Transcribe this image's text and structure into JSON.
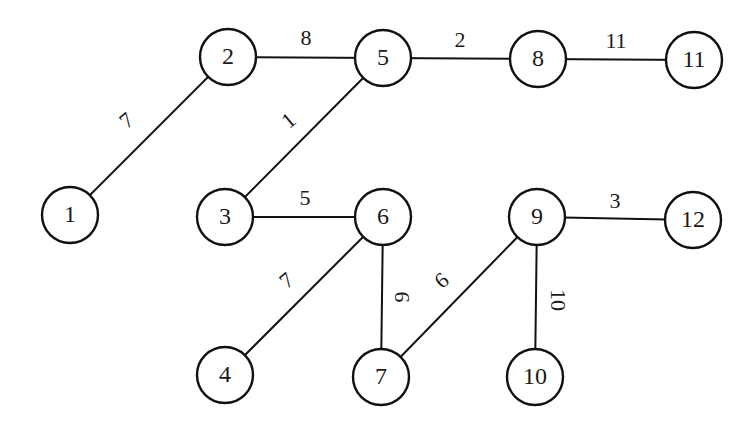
{
  "diagram": {
    "type": "weighted-undirected-graph",
    "style": {
      "line_color": "#111111",
      "background": "#ffffff",
      "node_radius": 28
    },
    "nodes": [
      {
        "id": "1",
        "label": "1",
        "x": 70,
        "y": 215
      },
      {
        "id": "2",
        "label": "2",
        "x": 228,
        "y": 57
      },
      {
        "id": "3",
        "label": "3",
        "x": 225,
        "y": 217
      },
      {
        "id": "4",
        "label": "4",
        "x": 225,
        "y": 375
      },
      {
        "id": "5",
        "label": "5",
        "x": 383,
        "y": 58
      },
      {
        "id": "6",
        "label": "6",
        "x": 383,
        "y": 217
      },
      {
        "id": "7",
        "label": "7",
        "x": 381,
        "y": 377
      },
      {
        "id": "8",
        "label": "8",
        "x": 538,
        "y": 59
      },
      {
        "id": "9",
        "label": "9",
        "x": 537,
        "y": 217
      },
      {
        "id": "10",
        "label": "10",
        "x": 535,
        "y": 377
      },
      {
        "id": "11",
        "label": "11",
        "x": 694,
        "y": 60
      },
      {
        "id": "12",
        "label": "12",
        "x": 693,
        "y": 220
      }
    ],
    "edges": [
      {
        "from": "1",
        "to": "2",
        "weight": "7",
        "label_x": 128,
        "label_y": 122,
        "rotate": -40
      },
      {
        "from": "2",
        "to": "5",
        "weight": "8",
        "label_x": 306,
        "label_y": 40,
        "rotate": 0
      },
      {
        "from": "5",
        "to": "8",
        "weight": "2",
        "label_x": 460,
        "label_y": 42,
        "rotate": 0
      },
      {
        "from": "8",
        "to": "11",
        "weight": "11",
        "label_x": 616,
        "label_y": 43,
        "rotate": 0
      },
      {
        "from": "3",
        "to": "5",
        "weight": "1",
        "label_x": 290,
        "label_y": 122,
        "rotate": -40
      },
      {
        "from": "3",
        "to": "6",
        "weight": "5",
        "label_x": 305,
        "label_y": 200,
        "rotate": 0
      },
      {
        "from": "4",
        "to": "6",
        "weight": "7",
        "label_x": 288,
        "label_y": 282,
        "rotate": -40
      },
      {
        "from": "6",
        "to": "7",
        "weight": "9",
        "label_x": 404,
        "label_y": 297,
        "rotate": -90
      },
      {
        "from": "7",
        "to": "9",
        "weight": "6",
        "label_x": 443,
        "label_y": 282,
        "rotate": -40
      },
      {
        "from": "9",
        "to": "12",
        "weight": "3",
        "label_x": 615,
        "label_y": 203,
        "rotate": 0
      },
      {
        "from": "9",
        "to": "10",
        "weight": "10",
        "label_x": 556,
        "label_y": 300,
        "rotate": 90
      }
    ]
  }
}
